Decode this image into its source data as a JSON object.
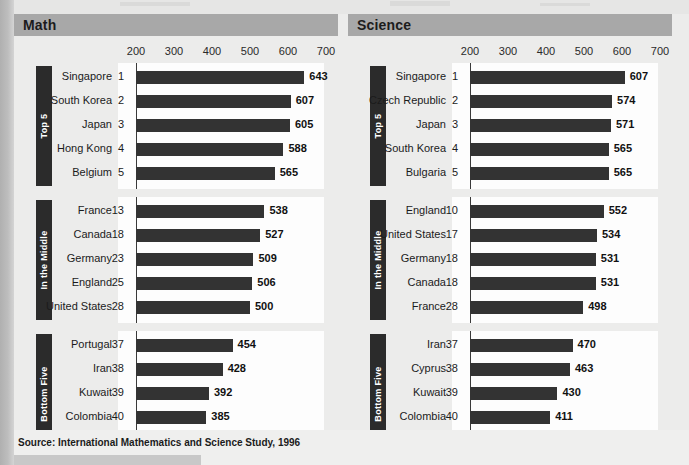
{
  "source_note": "Source:  International Mathematics and Science Study, 1996",
  "axis": {
    "ticks": [
      200,
      300,
      400,
      500,
      600,
      700
    ],
    "min": 200,
    "max": 700
  },
  "groups": [
    {
      "key": "top5",
      "label": "Top 5"
    },
    {
      "key": "middle",
      "label": "In the Middle"
    },
    {
      "key": "bottom",
      "label": "Bottom Five"
    }
  ],
  "chart_data": [
    {
      "type": "bar",
      "title": "Math",
      "xlabel": "",
      "ylabel": "",
      "orientation": "horizontal",
      "xlim": [
        200,
        700
      ],
      "ticks": [
        200,
        300,
        400,
        500,
        600,
        700
      ],
      "grid": false,
      "legend": "none",
      "groups": [
        {
          "name": "Top 5",
          "categories": [
            "Singapore",
            "South Korea",
            "Japan",
            "Hong Kong",
            "Belgium"
          ],
          "ranks": [
            1,
            2,
            3,
            4,
            5
          ],
          "values": [
            643,
            607,
            605,
            588,
            565
          ]
        },
        {
          "name": "In the Middle",
          "categories": [
            "France",
            "Canada",
            "Germany",
            "England",
            "United States"
          ],
          "ranks": [
            13,
            18,
            23,
            25,
            28
          ],
          "values": [
            538,
            527,
            509,
            506,
            500
          ]
        },
        {
          "name": "Bottom Five",
          "categories": [
            "Portugal",
            "Iran",
            "Kuwait",
            "Colombia",
            "South Africa"
          ],
          "ranks": [
            37,
            38,
            39,
            40,
            41
          ],
          "values": [
            454,
            428,
            392,
            385,
            354
          ]
        }
      ]
    },
    {
      "type": "bar",
      "title": "Science",
      "xlabel": "",
      "ylabel": "",
      "orientation": "horizontal",
      "xlim": [
        200,
        700
      ],
      "ticks": [
        200,
        300,
        400,
        500,
        600,
        700
      ],
      "grid": false,
      "legend": "none",
      "groups": [
        {
          "name": "Top 5",
          "categories": [
            "Singapore",
            "Czech Republic",
            "Japan",
            "South Korea",
            "Bulgaria"
          ],
          "ranks": [
            1,
            2,
            3,
            4,
            5
          ],
          "values": [
            607,
            574,
            571,
            565,
            565
          ]
        },
        {
          "name": "In the Middle",
          "categories": [
            "England",
            "United States",
            "Germany",
            "Canada",
            "France"
          ],
          "ranks": [
            10,
            17,
            18,
            18,
            28
          ],
          "values": [
            552,
            534,
            531,
            531,
            498
          ]
        },
        {
          "name": "Bottom Five",
          "categories": [
            "Iran",
            "Cyprus",
            "Kuwait",
            "Colombia",
            "South Africa"
          ],
          "ranks": [
            37,
            38,
            39,
            40,
            41
          ],
          "values": [
            470,
            463,
            430,
            411,
            326
          ]
        }
      ]
    }
  ],
  "colors": {
    "bar": "#333333",
    "panel_header": "#a8a8a8",
    "tab": "#2b2b2b",
    "plot_background": "#fdfdfd",
    "page_background": "#ececeb"
  }
}
